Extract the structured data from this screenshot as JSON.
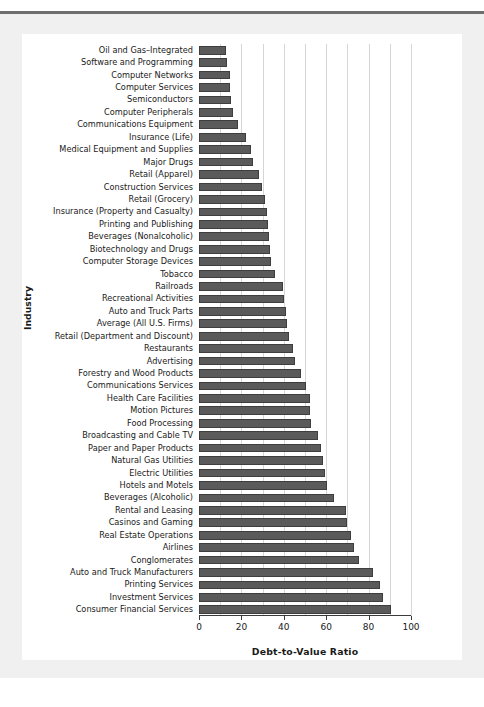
{
  "chart_data": {
    "type": "bar",
    "orientation": "horizontal",
    "title": "",
    "xlabel": "Debt-to-Value Ratio",
    "ylabel": "Industry",
    "xlim": [
      0,
      100
    ],
    "xticks": [
      0,
      20,
      40,
      60,
      80,
      100
    ],
    "xtick_labels": [
      "0",
      "20",
      "40",
      "60",
      "80",
      "100"
    ],
    "gridlines": [
      10,
      20,
      30,
      40,
      50,
      60,
      70,
      80,
      90,
      100
    ],
    "grid": true,
    "legend": "none",
    "bar_color": "#5a5a5a",
    "bar_edge_color": "#3e3e3e",
    "categories": [
      "Oil and Gas–Integrated",
      "Software and Programming",
      "Computer Networks",
      "Computer Services",
      "Semiconductors",
      "Computer Peripherals",
      "Communications Equipment",
      "Insurance (Life)",
      "Medical Equipment and Supplies",
      "Major Drugs",
      "Retail (Apparel)",
      "Construction Services",
      "Retail (Grocery)",
      "Insurance (Property and Casualty)",
      "Printing and Publishing",
      "Beverages (Nonalcoholic)",
      "Biotechnology and Drugs",
      "Computer Storage Devices",
      "Tobacco",
      "Railroads",
      "Recreational Activities",
      "Auto and Truck Parts",
      "Average (All U.S. Firms)",
      "Retail (Department and Discount)",
      "Restaurants",
      "Advertising",
      "Forestry and Wood Products",
      "Communications Services",
      "Health Care Facilities",
      "Motion Pictures",
      "Food Processing",
      "Broadcasting and Cable TV",
      "Paper and Paper Products",
      "Natural Gas Utilities",
      "Electric Utilities",
      "Hotels and Motels",
      "Beverages (Alcoholic)",
      "Rental and Leasing",
      "Casinos and Gaming",
      "Real Estate Operations",
      "Airlines",
      "Conglomerates",
      "Auto and Truck Manufacturers",
      "Printing Services",
      "Investment Services",
      "Consumer Financial Services"
    ],
    "values": [
      12.5,
      13.0,
      14.5,
      14.5,
      15.0,
      16.0,
      18.5,
      22.0,
      24.5,
      25.5,
      28.5,
      29.5,
      31.0,
      32.0,
      32.5,
      33.0,
      33.5,
      34.0,
      36.0,
      39.5,
      40.0,
      41.0,
      41.5,
      42.5,
      44.5,
      45.5,
      48.0,
      50.5,
      52.5,
      52.5,
      53.0,
      56.0,
      57.5,
      58.5,
      59.5,
      60.5,
      63.5,
      69.5,
      70.0,
      71.5,
      73.0,
      75.5,
      82.0,
      85.5,
      87.0,
      90.5
    ]
  }
}
